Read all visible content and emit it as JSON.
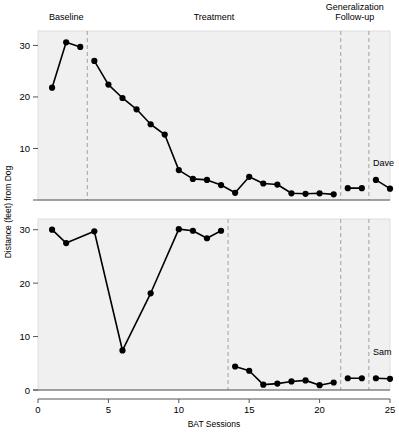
{
  "chart_data": {
    "type": "line",
    "title": "",
    "xlabel": "BAT Sessions",
    "ylabel": "Distance (feet) from Dog",
    "xlim": [
      0,
      25
    ],
    "xticks": [
      0,
      5,
      10,
      15,
      20,
      25
    ],
    "grid": false,
    "legend_position": "none",
    "panels": [
      {
        "name": "Dave",
        "subject_label": "Dave",
        "ylim": [
          0,
          32
        ],
        "yticks": [
          10,
          20,
          30
        ],
        "ytick_labels": [
          "10",
          "20",
          "30"
        ],
        "phase_labels": [
          {
            "text": "Baseline",
            "x": 2.0
          },
          {
            "text": "Treatment",
            "x": 12.5
          },
          {
            "text": "Generalization",
            "x": 22.5
          },
          {
            "text": "Follow-up",
            "x": 22.5
          }
        ],
        "phase_lines": [
          3.5,
          21.5,
          23.5
        ],
        "series": [
          {
            "name": "Baseline",
            "x": [
              1,
              2,
              3
            ],
            "y": [
              21.8,
              30.6,
              29.7
            ]
          },
          {
            "name": "Treatment",
            "x": [
              4,
              5,
              6,
              7,
              8,
              9,
              10,
              11,
              12,
              13,
              14,
              15,
              16,
              17,
              18,
              19,
              20,
              21
            ],
            "y": [
              27.0,
              22.4,
              19.8,
              17.6,
              14.7,
              12.7,
              5.8,
              4.1,
              3.9,
              2.9,
              1.4,
              4.5,
              3.2,
              3.0,
              1.3,
              1.2,
              1.3,
              1.1
            ]
          },
          {
            "name": "Generalization",
            "x": [
              22,
              23
            ],
            "y": [
              2.3,
              2.3
            ]
          },
          {
            "name": "Follow-up",
            "x": [
              24,
              25
            ],
            "y": [
              3.9,
              2.2
            ]
          }
        ]
      },
      {
        "name": "Sam",
        "subject_label": "Sam",
        "ylim": [
          0,
          32
        ],
        "yticks": [
          0,
          10,
          20,
          30
        ],
        "ytick_labels": [
          "0",
          "10",
          "20",
          "30"
        ],
        "phase_labels": [],
        "phase_lines": [
          13.5,
          21.5,
          23.5
        ],
        "series": [
          {
            "name": "Baseline",
            "x": [
              1,
              2,
              4,
              6,
              8,
              10,
              11,
              12,
              13
            ],
            "y": [
              30.0,
              27.5,
              29.7,
              7.4,
              18.1,
              30.1,
              29.8,
              28.4,
              29.8
            ]
          },
          {
            "name": "Treatment",
            "x": [
              14,
              15,
              16,
              17,
              18,
              19,
              20,
              21
            ],
            "y": [
              4.4,
              3.6,
              1.0,
              1.2,
              1.6,
              1.8,
              0.9,
              1.4
            ]
          },
          {
            "name": "Generalization",
            "x": [
              22,
              23
            ],
            "y": [
              2.2,
              2.2
            ]
          },
          {
            "name": "Follow-up",
            "x": [
              24,
              25
            ],
            "y": [
              2.2,
              2.1
            ]
          }
        ]
      }
    ],
    "colors": {
      "line": "#000000",
      "marker": "#000000",
      "panel_background": "#f0f0f0",
      "phase_line": "#a0a0a0",
      "axis": "#555555"
    }
  }
}
